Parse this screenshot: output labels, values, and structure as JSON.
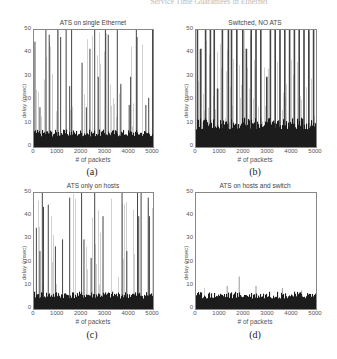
{
  "header": {
    "text": "Service Time Guarantees in Ethernet"
  },
  "chart_data": [
    {
      "type": "bar",
      "id": "a",
      "title": "ATS on single Ethernet",
      "caption": "(a)",
      "xlabel": "# of packets",
      "ylabel": "delay (msec)",
      "xlim": [
        0,
        5000
      ],
      "ylim": [
        0,
        50
      ],
      "xticks": [
        "0",
        "1000",
        "2000",
        "3000",
        "4000",
        "5000"
      ],
      "yticks": [
        "0",
        "10",
        "20",
        "30",
        "40",
        "50"
      ],
      "grid": false,
      "baseline_level": 6,
      "spikes": [
        [
          40,
          45
        ],
        [
          250,
          17
        ],
        [
          500,
          50
        ],
        [
          640,
          48
        ],
        [
          1000,
          50
        ],
        [
          1120,
          47
        ],
        [
          1350,
          50
        ],
        [
          1500,
          26
        ],
        [
          1580,
          50
        ],
        [
          2020,
          36
        ],
        [
          2200,
          17
        ],
        [
          2350,
          42
        ],
        [
          2550,
          50
        ],
        [
          2700,
          30
        ],
        [
          3000,
          50
        ],
        [
          3120,
          48
        ],
        [
          3500,
          50
        ],
        [
          3650,
          27
        ],
        [
          4000,
          18
        ],
        [
          4060,
          30
        ],
        [
          4300,
          50
        ],
        [
          4330,
          47
        ],
        [
          4700,
          18
        ],
        [
          4820,
          21
        ],
        [
          4980,
          50
        ]
      ]
    },
    {
      "type": "bar",
      "id": "b",
      "title": "Switched, NO ATS",
      "caption": "(b)",
      "xlabel": "# of packets",
      "ylabel": "delay (msec)",
      "xlim": [
        0,
        5000
      ],
      "ylim": [
        0,
        50
      ],
      "xticks": [
        "0",
        "1000",
        "2000",
        "3000",
        "4000",
        "5000"
      ],
      "yticks": [
        "0",
        "10",
        "20",
        "30",
        "40",
        "50"
      ],
      "grid": false,
      "baseline_level": 10,
      "spikes": [
        [
          60,
          50
        ],
        [
          200,
          42
        ],
        [
          400,
          50
        ],
        [
          600,
          50
        ],
        [
          760,
          50
        ],
        [
          900,
          25
        ],
        [
          1100,
          50
        ],
        [
          1350,
          50
        ],
        [
          1480,
          50
        ],
        [
          1700,
          50
        ],
        [
          1950,
          50
        ],
        [
          2100,
          42
        ],
        [
          2300,
          50
        ],
        [
          2500,
          50
        ],
        [
          2700,
          50
        ],
        [
          2950,
          30
        ],
        [
          3100,
          50
        ],
        [
          3300,
          50
        ],
        [
          3500,
          50
        ],
        [
          3700,
          50
        ],
        [
          3900,
          50
        ],
        [
          4100,
          50
        ],
        [
          4300,
          50
        ],
        [
          4500,
          50
        ],
        [
          4700,
          50
        ],
        [
          4900,
          50
        ]
      ]
    },
    {
      "type": "bar",
      "id": "c",
      "title": "ATS only on hosts",
      "caption": "(c)",
      "xlabel": "# of packets",
      "ylabel": "delay (msec)",
      "xlim": [
        0,
        5000
      ],
      "ylim": [
        0,
        50
      ],
      "xticks": [
        "0",
        "1000",
        "2000",
        "3000",
        "4000",
        "5000"
      ],
      "yticks": [
        "0",
        "10",
        "20",
        "30",
        "40",
        "50"
      ],
      "grid": false,
      "baseline_level": 6,
      "spikes": [
        [
          100,
          35
        ],
        [
          250,
          25
        ],
        [
          350,
          50
        ],
        [
          400,
          44
        ],
        [
          600,
          45
        ],
        [
          900,
          27
        ],
        [
          1200,
          30
        ],
        [
          1500,
          48
        ],
        [
          2000,
          50
        ],
        [
          2100,
          30
        ],
        [
          2400,
          22
        ],
        [
          2550,
          50
        ],
        [
          2900,
          40
        ],
        [
          3700,
          50
        ],
        [
          3900,
          25
        ],
        [
          4350,
          50
        ],
        [
          4400,
          40
        ],
        [
          4500,
          50
        ],
        [
          4800,
          48
        ],
        [
          4850,
          40
        ]
      ]
    },
    {
      "type": "bar",
      "id": "d",
      "title": "ATS on hosts and switch",
      "caption": "(d)",
      "xlabel": "# of packets",
      "ylabel": "delay (msec)",
      "xlim": [
        0,
        5000
      ],
      "ylim": [
        0,
        50
      ],
      "xticks": [
        "0",
        "1000",
        "2000",
        "3000",
        "4000",
        "5000"
      ],
      "yticks": [
        "0",
        "10",
        "20",
        "30",
        "40",
        "50"
      ],
      "grid": false,
      "baseline_level": 6,
      "spikes": [
        [
          1300,
          10
        ],
        [
          1800,
          14
        ],
        [
          2500,
          10
        ],
        [
          3600,
          9
        ],
        [
          4400,
          8
        ]
      ]
    }
  ]
}
